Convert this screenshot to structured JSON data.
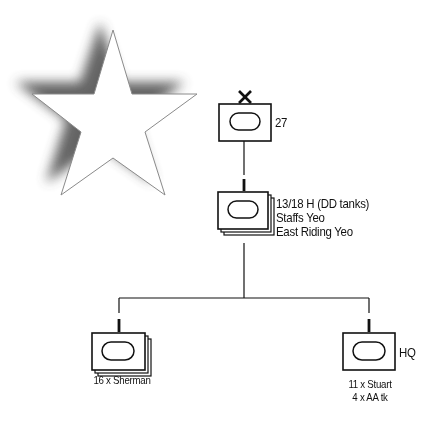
{
  "diagram": {
    "type": "military-order-of-battle",
    "colors": {
      "line": "#111111",
      "background": "#ffffff",
      "star_fill": "#ffffff",
      "star_shadow": "#555555"
    },
    "star": {
      "icon": "star-icon",
      "style": "white-star-with-drop-shadow"
    },
    "nodes": [
      {
        "id": "brigade",
        "size_marker": "X",
        "echelon": "brigade",
        "symbol": "armour",
        "label": "27"
      },
      {
        "id": "regiments",
        "symbol": "armour-stacked",
        "label_lines": [
          "13/18 H (DD tanks)",
          "Staffs Yeo",
          "East Riding Yeo"
        ]
      },
      {
        "id": "squadrons",
        "symbol": "armour-stacked",
        "caption": "16 x Sherman"
      },
      {
        "id": "hq",
        "symbol": "armour",
        "label": "HQ",
        "caption_lines": [
          "11 x Stuart",
          "4 x AA tk"
        ]
      }
    ],
    "edges": [
      {
        "from": "brigade",
        "to": "regiments"
      },
      {
        "from": "regiments",
        "to": "squadrons"
      },
      {
        "from": "regiments",
        "to": "hq"
      }
    ]
  }
}
